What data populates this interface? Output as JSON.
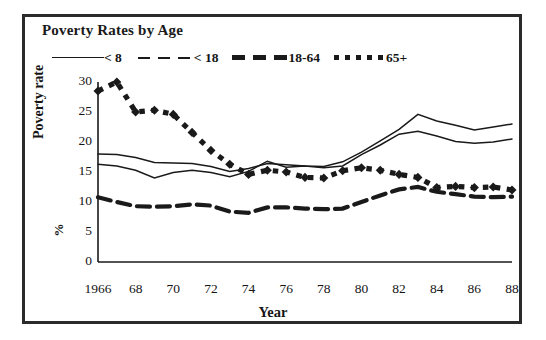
{
  "chart_data": {
    "type": "line",
    "title": "Poverty Rates by Age",
    "xlabel": "Year",
    "ylabel": "Poverty rate",
    "ylabel_unit": "%",
    "ylim": [
      0,
      30
    ],
    "yticks": [
      0,
      5,
      10,
      15,
      20,
      25,
      30
    ],
    "xlim": [
      1966,
      1988
    ],
    "xticks": [
      1966,
      1968,
      1970,
      1972,
      1974,
      1976,
      1978,
      1980,
      1982,
      1984,
      1986,
      1988
    ],
    "xtick_labels": [
      "1966",
      "68",
      "70",
      "72",
      "74",
      "76",
      "78",
      "80",
      "82",
      "84",
      "86",
      "88"
    ],
    "grid": false,
    "legend_position": "top",
    "x": [
      1966,
      1967,
      1968,
      1969,
      1970,
      1971,
      1972,
      1973,
      1974,
      1975,
      1976,
      1977,
      1978,
      1979,
      1980,
      1981,
      1982,
      1983,
      1984,
      1985,
      1986,
      1987,
      1988
    ],
    "series": [
      {
        "name": "< 8",
        "style": "thin-solid",
        "values": [
          18.0,
          17.9,
          17.4,
          16.6,
          16.5,
          16.4,
          15.9,
          15.1,
          15.6,
          16.4,
          16.2,
          16.0,
          15.9,
          16.7,
          18.3,
          20.2,
          22.1,
          24.6,
          23.5,
          22.8,
          22.0,
          22.5,
          23.0
        ]
      },
      {
        "name": "< 18",
        "style": "thin-dashed",
        "values": [
          16.3,
          16.0,
          15.3,
          14.0,
          14.9,
          15.3,
          14.9,
          14.2,
          15.1,
          16.8,
          15.8,
          16.0,
          15.7,
          16.0,
          17.9,
          19.5,
          21.3,
          21.8,
          21.0,
          20.1,
          19.8,
          20.0,
          20.5
        ]
      },
      {
        "name": "18-64",
        "style": "thick-dashed",
        "values": [
          10.8,
          10.0,
          9.3,
          9.2,
          9.3,
          9.6,
          9.4,
          8.4,
          8.2,
          9.1,
          9.1,
          8.9,
          8.8,
          8.9,
          10.0,
          11.1,
          12.1,
          12.5,
          11.7,
          11.3,
          10.9,
          10.8,
          10.9
        ]
      },
      {
        "name": "65+",
        "style": "square-dotted",
        "values": [
          28.5,
          30.0,
          25.0,
          25.3,
          24.6,
          21.6,
          18.6,
          16.3,
          14.6,
          15.3,
          15.0,
          14.1,
          14.0,
          15.2,
          15.7,
          15.3,
          14.6,
          14.1,
          12.4,
          12.6,
          12.4,
          12.5,
          12.0
        ]
      }
    ]
  },
  "legend": {
    "entries": [
      {
        "label": "< 8",
        "marker": "thin-solid-line-icon"
      },
      {
        "label": "< 18",
        "marker": "thin-dashed-line-icon"
      },
      {
        "label": "18-64",
        "marker": "thick-dashed-line-icon"
      },
      {
        "label": "65+",
        "marker": "square-dotted-line-icon"
      }
    ]
  },
  "colors": {
    "ink": "#1a1a1a",
    "frame": "#2b2b2b",
    "background": "#ffffff"
  }
}
